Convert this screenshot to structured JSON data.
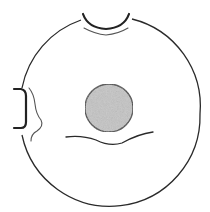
{
  "diagram": {
    "type": "schematic line drawing",
    "description": "Circular outline with a notch at the top, a bracket-shaped indentation at the left, a shaded central disc, and a wavy line beneath the disc",
    "colors": {
      "background": "#ffffff",
      "stroke": "#2a2a2a",
      "light_stroke": "#555555",
      "disc_fill": "#c4c4c4",
      "disc_stroke": "#3a3a3a"
    },
    "elements": [
      {
        "name": "outer-circle",
        "shape": "circle",
        "center": [
          110,
          114
        ],
        "radius": 90
      },
      {
        "name": "top-notch",
        "shape": "arc",
        "from": [
          83,
          14
        ],
        "to": [
          130,
          14
        ],
        "depth_y": 34
      },
      {
        "name": "top-notch-inner-line",
        "shape": "arc",
        "from": [
          84,
          28
        ],
        "to": [
          128,
          28
        ],
        "depth_y": 36
      },
      {
        "name": "left-bracket",
        "shape": "bracket",
        "top": [
          14,
          89
        ],
        "bottom": [
          14,
          129
        ],
        "depth_x": 26
      },
      {
        "name": "left-wavy-line",
        "shape": "curve",
        "from": [
          29,
          88
        ],
        "to": [
          31,
          141
        ]
      },
      {
        "name": "central-disc",
        "shape": "circle",
        "center": [
          109,
          108
        ],
        "radius": 24
      },
      {
        "name": "lower-wavy-line",
        "shape": "curve",
        "from": [
          66,
          137
        ],
        "to": [
          153,
          132
        ]
      }
    ]
  }
}
